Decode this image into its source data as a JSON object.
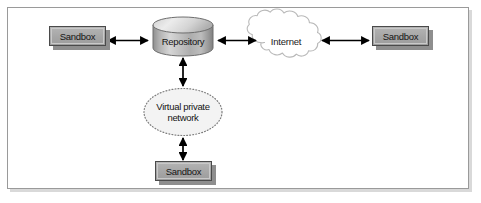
{
  "figure": {
    "type": "network-diagram",
    "background_color": "#ffffff",
    "frame_border_color": "#9a9a9a",
    "arrow_color": "#000000"
  },
  "nodes": {
    "sandbox_left": {
      "label": "Sandbox",
      "shape": "rectangle",
      "fill_color": "#a9a9a9",
      "border_color": "#4a4a4a",
      "shadow_color": "#8e8e8e"
    },
    "repository": {
      "label": "Repository",
      "shape": "cylinder",
      "fill_color": "#b9b9b9",
      "border_color": "#6b6b6b"
    },
    "internet": {
      "label": "Internet",
      "shape": "cloud",
      "fill_color": "#ffffff",
      "border_color": "#b5b5b5"
    },
    "sandbox_right": {
      "label": "Sandbox",
      "shape": "rectangle",
      "fill_color": "#a9a9a9",
      "border_color": "#4a4a4a",
      "shadow_color": "#8e8e8e"
    },
    "vpn": {
      "label": "Virtual private\nnetwork",
      "shape": "ellipse",
      "fill_color": "#f2f2f2",
      "border_color": "#8c8c8c",
      "border_style": "dotted"
    },
    "sandbox_bottom": {
      "label": "Sandbox",
      "shape": "rectangle",
      "fill_color": "#a9a9a9",
      "border_color": "#4a4a4a",
      "shadow_color": "#8e8e8e"
    }
  },
  "connections": [
    {
      "name": "sandbox-left-to-repository",
      "from": "sandbox_left",
      "to": "repository",
      "style": "double-arrow",
      "orientation": "horizontal"
    },
    {
      "name": "repository-to-internet",
      "from": "repository",
      "to": "internet",
      "style": "double-arrow",
      "orientation": "horizontal"
    },
    {
      "name": "internet-to-sandbox-right",
      "from": "internet",
      "to": "sandbox_right",
      "style": "double-arrow",
      "orientation": "horizontal"
    },
    {
      "name": "repository-to-vpn",
      "from": "repository",
      "to": "vpn",
      "style": "double-arrow",
      "orientation": "vertical"
    },
    {
      "name": "vpn-to-sandbox-bottom",
      "from": "vpn",
      "to": "sandbox_bottom",
      "style": "double-arrow",
      "orientation": "vertical"
    }
  ]
}
